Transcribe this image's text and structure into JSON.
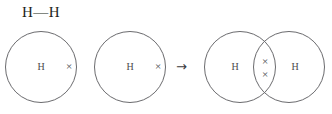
{
  "diagram": {
    "title_formula": "H—H",
    "reaction_arrow": "→",
    "reactants": [
      {
        "atom_label": "H",
        "electrons": [
          "×"
        ],
        "shell_shape": "circle"
      },
      {
        "atom_label": "H",
        "electrons": [
          "×"
        ],
        "shell_shape": "circle"
      }
    ],
    "product": {
      "left_atom_label": "H",
      "right_atom_label": "H",
      "shared_electrons": [
        "×",
        "×"
      ],
      "shell_shape": "overlapping-circles"
    },
    "colors": {
      "background": "#ffffff",
      "stroke": "#6b6b6e",
      "text": "#4a4a4d",
      "formula_text": "#231f20",
      "arrow": "#3a3a3d"
    }
  }
}
